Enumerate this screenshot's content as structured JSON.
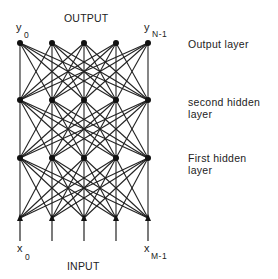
{
  "diagram": {
    "type": "feedforward-neural-network",
    "top_title": "OUTPUT",
    "bottom_title": "INPUT",
    "output_first_var": "y",
    "output_first_sub": "0",
    "output_last_var": "y",
    "output_last_sub": "N-1",
    "input_first_var": "x",
    "input_first_sub": "0",
    "input_last_var": "x",
    "input_last_sub": "M-1",
    "layers": [
      {
        "name": "Output layer",
        "label_line1": "Output layer",
        "label_line2": "",
        "nodes": 5
      },
      {
        "name": "second hidden layer",
        "label_line1": "second hidden",
        "label_line2": "layer",
        "nodes": 5
      },
      {
        "name": "First hidden layer",
        "label_line1": "First hidden",
        "label_line2": "layer",
        "nodes": 5
      },
      {
        "name": "Input",
        "nodes": 5
      }
    ],
    "connectivity": "fully-connected",
    "colors": {
      "line": "#222222",
      "node": "#111111",
      "background": "#ffffff"
    }
  }
}
